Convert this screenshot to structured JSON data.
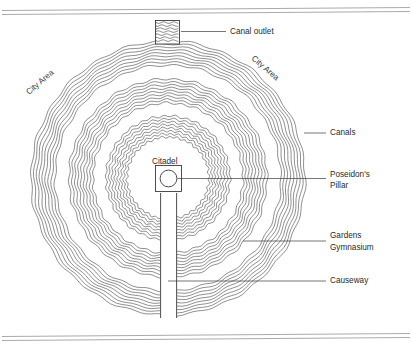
{
  "diagram": {
    "type": "concentric-city-plan",
    "labels": {
      "canal_outlet": "Canal outlet",
      "city_area_left": "City Area",
      "city_area_right": "City Area",
      "canals": "Canals",
      "citadel": "Citadel",
      "poseidons_pillar": "Poseidon's\nPillar",
      "poseidons_pillar_line1": "Poseidon's",
      "poseidons_pillar_line2": "Pillar",
      "gardens_gymnasium_line1": "Gardens",
      "gardens_gymnasium_line2": "Gymnasium",
      "causeway": "Causeway"
    },
    "colors": {
      "ink": "#4a4a4a",
      "text": "#2a2a2a",
      "leader": "#3b3b3b",
      "rule": "#8d8d8d",
      "background": "#ffffff"
    },
    "structure": {
      "ring_bands": 3,
      "lines_per_band": 9,
      "center": {
        "x": 168,
        "y": 178
      },
      "citadel_shape": "square-with-circle",
      "causeway_orientation": "vertical-south",
      "canal_outlet_position": "north"
    }
  },
  "chart_data": {
    "type": "diagram",
    "annotations": [
      "Canal outlet",
      "City Area",
      "City Area",
      "Canals",
      "Citadel",
      "Poseidon's Pillar",
      "Gardens Gymnasium",
      "Causeway"
    ],
    "rings": [
      {
        "name": "outer canal",
        "radius_px": 137,
        "band_width_px": 24,
        "lines": 9
      },
      {
        "name": "middle canal",
        "radius_px": 99,
        "band_width_px": 24,
        "lines": 9
      },
      {
        "name": "inner canal",
        "radius_px": 62,
        "band_width_px": 21,
        "lines": 8
      }
    ]
  }
}
